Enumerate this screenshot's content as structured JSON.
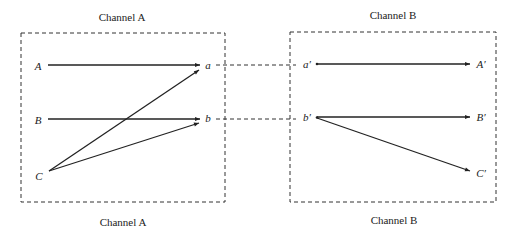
{
  "diagram": {
    "channel_a": {
      "title_top": "Channel A",
      "title_bottom": "Channel A",
      "inputs": [
        "A",
        "B",
        "C"
      ],
      "outputs": [
        "a",
        "b"
      ]
    },
    "channel_b": {
      "title_top": "Channel B",
      "title_bottom": "Channel B",
      "inputs": [
        "a′",
        "b′"
      ],
      "outputs": [
        "A′",
        "B′",
        "C′"
      ]
    },
    "edges": [
      {
        "from": "A",
        "to": "a"
      },
      {
        "from": "B",
        "to": "b"
      },
      {
        "from": "C",
        "to": "a"
      },
      {
        "from": "C",
        "to": "b"
      },
      {
        "from": "a′",
        "to": "A′"
      },
      {
        "from": "b′",
        "to": "B′"
      },
      {
        "from": "b′",
        "to": "C′"
      }
    ],
    "links": [
      {
        "from": "a",
        "to": "a′",
        "style": "dashed"
      },
      {
        "from": "b",
        "to": "b′",
        "style": "dashed"
      }
    ],
    "colors": {
      "line": "#222222",
      "background": "#ffffff"
    }
  }
}
